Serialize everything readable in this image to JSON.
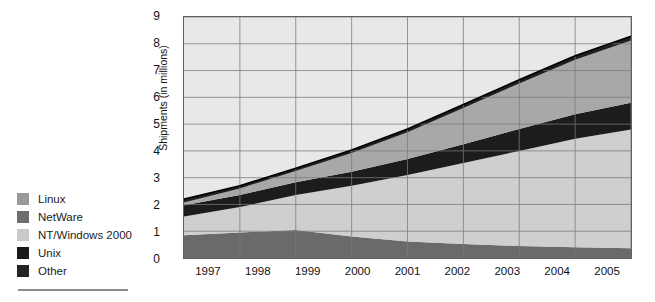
{
  "legend": {
    "title": "",
    "items": [
      {
        "label": "Linux",
        "color": "#9a9a9a",
        "key": "linux"
      },
      {
        "label": "NetWare",
        "color": "#6e6e6e",
        "key": "netware"
      },
      {
        "label": "NT/Windows 2000",
        "color": "#c9c9c9",
        "key": "nt_windows_2000"
      },
      {
        "label": "Unix",
        "color": "#1a1a1a",
        "key": "unix"
      },
      {
        "label": "Other",
        "color": "#242424",
        "key": "other"
      }
    ]
  },
  "chart_data": {
    "type": "area",
    "stacked": true,
    "title": "",
    "subtitle": "",
    "xlabel": "",
    "ylabel": "Shipments (in millions)",
    "categories": [
      "1997",
      "1998",
      "1999",
      "2000",
      "2001",
      "2002",
      "2003",
      "2004",
      "2005"
    ],
    "x": [
      1997,
      1998,
      1999,
      2000,
      2001,
      2002,
      2003,
      2004,
      2005
    ],
    "ylim": [
      0,
      9
    ],
    "yticks": [
      0,
      1,
      2,
      3,
      4,
      5,
      6,
      7,
      8,
      9
    ],
    "ytick_labels": [
      "0",
      "1",
      "2",
      "3",
      "4",
      "5",
      "6",
      "7",
      "8",
      "9"
    ],
    "grid": true,
    "grid_axis": "both",
    "legend_position": "left-outside",
    "series": [
      {
        "name": "Other",
        "color": "#6a6a6a",
        "values": [
          0.85,
          0.95,
          1.05,
          0.8,
          0.62,
          0.52,
          0.45,
          0.4,
          0.36
        ]
      },
      {
        "name": "NT/Windows 2000",
        "color": "#cfcfcf",
        "values": [
          0.7,
          0.95,
          1.3,
          1.9,
          2.48,
          3.03,
          3.55,
          4.05,
          4.44
        ]
      },
      {
        "name": "Unix",
        "color": "#1c1c1c",
        "values": [
          0.42,
          0.45,
          0.48,
          0.52,
          0.6,
          0.7,
          0.82,
          0.92,
          1.0
        ]
      },
      {
        "name": "NetWare",
        "color": "#a8a8a8",
        "values": [
          0.1,
          0.25,
          0.42,
          0.7,
          1.0,
          1.35,
          1.7,
          2.03,
          2.32
        ]
      },
      {
        "name": "Linux",
        "color": "#1f1f1f",
        "values": [
          0.13,
          0.1,
          0.1,
          0.11,
          0.12,
          0.13,
          0.14,
          0.15,
          0.16
        ]
      }
    ],
    "totals": [
      2.2,
      2.7,
      3.35,
      4.03,
      4.82,
      5.73,
      6.66,
      7.55,
      8.28
    ],
    "plot_bg": "#e8e8e8",
    "grid_color": "#7a7a7a",
    "axis_color": "#5f5f5f"
  }
}
